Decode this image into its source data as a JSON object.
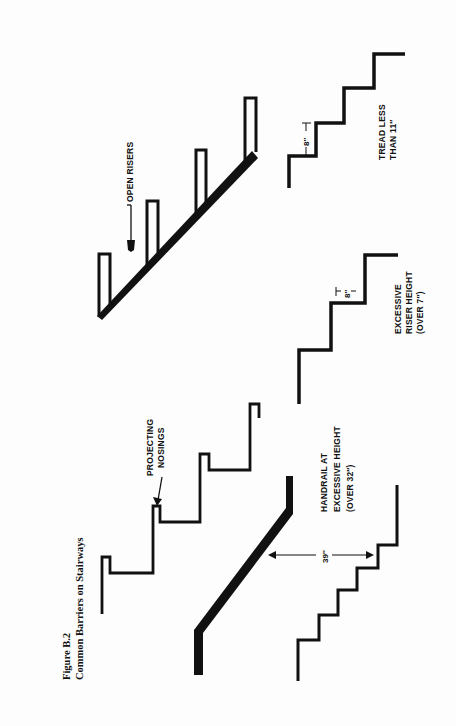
{
  "figure": {
    "number": "Figure  B.2",
    "title": "Common Barriers on Stairways",
    "orientation": "rotated 90 degrees counter-clockwise"
  },
  "panels": [
    {
      "id": "open-risers",
      "labels": [
        "OPEN RISERS"
      ]
    },
    {
      "id": "tread-less",
      "dimension": "8″",
      "labels": [
        "TREAD LESS",
        "THAN  11″"
      ]
    },
    {
      "id": "excessive-riser",
      "dimension": "8″",
      "labels": [
        "EXCESSIVE",
        "RISER HEIGHT",
        "(OVER 7″)"
      ]
    },
    {
      "id": "projecting-nosings",
      "labels": [
        "PROJECTING",
        "NOSINGS"
      ]
    },
    {
      "id": "handrail-height",
      "dimension": "39″",
      "labels": [
        "HANDRAIL AT",
        "EXCESSIVE HEIGHT",
        "(OVER 32″)"
      ]
    }
  ]
}
